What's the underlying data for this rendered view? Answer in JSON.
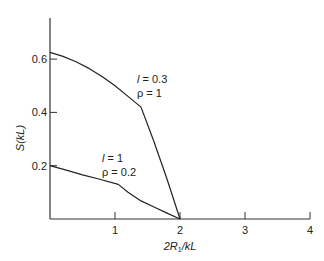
{
  "chart_data": {
    "type": "line",
    "title": "",
    "xlabel": "2R1/kL",
    "ylabel": "S(kL)",
    "xlim": [
      0,
      4
    ],
    "ylim": [
      0,
      0.7
    ],
    "x_ticks": [
      1,
      2,
      3,
      4
    ],
    "y_ticks": [
      0.2,
      0.4,
      0.6
    ],
    "x_tick_labels": [
      "1",
      "2",
      "3",
      "4"
    ],
    "y_tick_labels": [
      "0.2",
      "0.4",
      "0.6"
    ],
    "grid": false,
    "legend": null,
    "series": [
      {
        "name": "l = 0.3, ρ = 1",
        "annotation": [
          "l = 0.3",
          "ρ = 1"
        ],
        "x": [
          0,
          0.2,
          0.4,
          0.6,
          0.8,
          1.0,
          1.2,
          1.4,
          1.6,
          1.8,
          2.0
        ],
        "y": [
          0.625,
          0.61,
          0.59,
          0.565,
          0.535,
          0.5,
          0.46,
          0.42,
          0.29,
          0.15,
          0.0
        ]
      },
      {
        "name": "l = 1, ρ = 0.2",
        "annotation": [
          "l = 1",
          "ρ = 0.2"
        ],
        "x": [
          0,
          0.25,
          0.5,
          0.75,
          1.05,
          1.2,
          1.4,
          1.6,
          1.8,
          2.0
        ],
        "y": [
          0.2,
          0.183,
          0.166,
          0.15,
          0.13,
          0.1,
          0.068,
          0.045,
          0.022,
          0.0
        ]
      }
    ]
  },
  "labels": {
    "ylabel_main": "S(kL)",
    "xlabel_prefix": "2R",
    "xlabel_sub": "1",
    "xlabel_suffix": "/kL",
    "curve1_line1": "l = 0.3",
    "curve1_line2": "ρ = 1",
    "curve2_line1": "l = 1",
    "curve2_line2": "ρ = 0.2"
  }
}
